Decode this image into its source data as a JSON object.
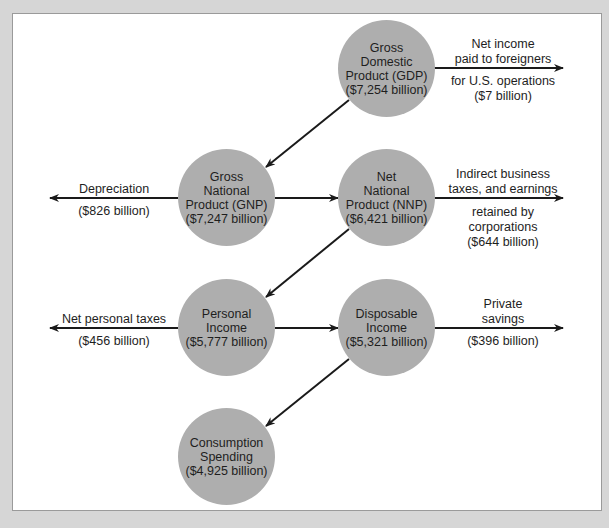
{
  "nodes": {
    "gdp": {
      "lines": [
        "Gross",
        "Domestic",
        "Product (GDP)",
        "($7,254 billion)"
      ]
    },
    "gnp": {
      "lines": [
        "Gross",
        "National",
        "Product (GNP)",
        "($7,247 billion)"
      ]
    },
    "nnp": {
      "lines": [
        "Net",
        "National",
        "Product (NNP)",
        "($6,421 billion)"
      ]
    },
    "personal_income": {
      "lines": [
        "Personal",
        "Income",
        "($5,777 billion)"
      ]
    },
    "disposable_income": {
      "lines": [
        "Disposable",
        "Income",
        "($5,321 billion)"
      ]
    },
    "consumption": {
      "lines": [
        "Consumption",
        "Spending",
        "($4,925 billion)"
      ]
    }
  },
  "flows": {
    "net_income_foreigners": {
      "above": [
        "Net income",
        "paid to foreigners"
      ],
      "below": [
        "for U.S. operations",
        "($7 billion)"
      ]
    },
    "depreciation": {
      "above": [
        "Depreciation"
      ],
      "below": [
        "($826 billion)"
      ]
    },
    "indirect_taxes": {
      "above": [
        "Indirect business",
        "taxes, and earnings"
      ],
      "below": [
        "retained by",
        "corporations",
        "($644 billion)"
      ]
    },
    "net_personal_taxes": {
      "above": [
        "Net personal taxes"
      ],
      "below": [
        "($456 billion)"
      ]
    },
    "private_savings": {
      "above": [
        "Private",
        "savings"
      ],
      "below": [
        "($396 billion)"
      ]
    }
  },
  "colors": {
    "circle_fill": "#aeaeae",
    "arrow": "#1a1a1a",
    "page_bg": "#d6d6d6",
    "frame_bg": "#ffffff"
  }
}
